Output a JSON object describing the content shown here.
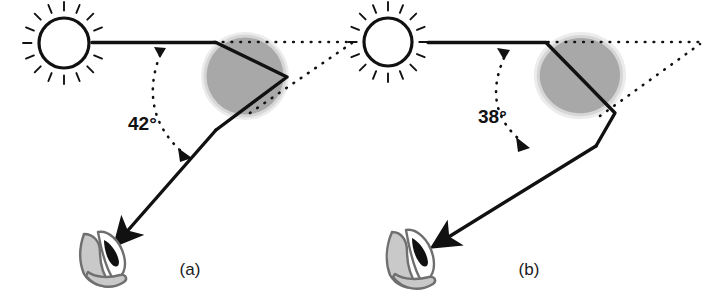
{
  "figure": {
    "background_color": "#ffffff",
    "width": 718,
    "height": 307
  },
  "palette": {
    "ink": "#111111",
    "drop_fill": "#a8a8a8",
    "drop_halo": "#ececec",
    "drop_rim": "#d0d0d0",
    "head_fill": "#c9c9c9",
    "head_outline": "#6f6f6f",
    "eye_fill": "#111111",
    "dotted": "#111111",
    "white": "#ffffff"
  },
  "panels": [
    {
      "id": "a",
      "caption": "(a)",
      "angle_label": "42°",
      "angle_value": 42,
      "sun": {
        "name": "sun",
        "rays": 16
      },
      "raindrop": {
        "name": "raindrop",
        "shape": "circle"
      },
      "observer": {
        "name": "observer-head",
        "eye": "eye"
      },
      "rays": {
        "incoming": "sunlight-ray",
        "internal": "internal-reflection-path",
        "outgoing": "exit-ray-to-observer"
      },
      "guides": {
        "dotted_horizontal": "dotted-reference-line",
        "dotted_arc": "angle-arc",
        "dotted_exit": "dotted-exit-extension"
      }
    },
    {
      "id": "b",
      "caption": "(b)",
      "angle_label": "38°",
      "angle_value": 38,
      "sun": {
        "name": "sun",
        "rays": 16
      },
      "raindrop": {
        "name": "raindrop",
        "shape": "blob"
      },
      "observer": {
        "name": "observer-head",
        "eye": "eye"
      },
      "rays": {
        "incoming": "sunlight-ray",
        "internal": "internal-reflection-path",
        "outgoing": "exit-ray-to-observer"
      },
      "guides": {
        "dotted_horizontal": "dotted-reference-line",
        "dotted_arc": "angle-arc",
        "dotted_exit": "dotted-exit-extension"
      }
    }
  ]
}
